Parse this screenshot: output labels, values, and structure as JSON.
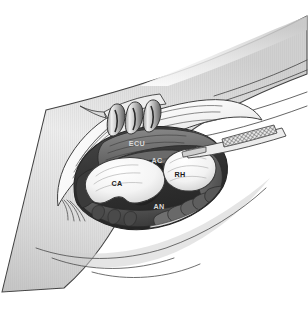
{
  "figure": {
    "type": "anatomical-surgical-illustration",
    "style": "grayscale line-and-tone medical illustration",
    "background_color": "#ffffff",
    "width": 308,
    "height": 330
  },
  "labels": [
    {
      "id": "ecu",
      "text": "ECU",
      "meaning": "extensor carpi ulnaris",
      "x": 137,
      "y": 146,
      "tone": "on-dark"
    },
    {
      "id": "ac",
      "text": "AC",
      "meaning": "articular capsule",
      "x": 157,
      "y": 163,
      "tone": "on-dark"
    },
    {
      "id": "ca",
      "text": "CA",
      "meaning": "capitellum",
      "x": 117,
      "y": 186,
      "tone": "on-light"
    },
    {
      "id": "rh",
      "text": "RH",
      "meaning": "radial head",
      "x": 180,
      "y": 177,
      "tone": "on-light"
    },
    {
      "id": "an",
      "text": "AN",
      "meaning": "anconeus",
      "x": 159,
      "y": 209,
      "tone": "on-dark"
    }
  ],
  "colors": {
    "paper": "#ffffff",
    "skin_light": "#f4f4f4",
    "skin_mid": "#d9d9d9",
    "skin_shadow": "#b8b8b8",
    "outline": "#3a3a3a",
    "cavity_deep": "#2b2b2b",
    "cavity_dark": "#3c3c3c",
    "muscle_mid": "#6e6e6e",
    "muscle_light": "#8d8d8d",
    "bone_white": "#f7f7f7",
    "bone_shade": "#d2d2d2",
    "metal_light": "#e6e6e6",
    "metal_dark": "#4a4a4a",
    "hatch": "#555555"
  },
  "structures": {
    "limb": "forearm / elbow region shown as a broad curved band running from lower-left to upper-right",
    "wound": "open elliptical surgical wound cavity in the centre of the limb",
    "retractor": "three-prong self-retaining retractor engaging the proximal wound edge",
    "instrument": "cross-hatched instrument blade entering the wound from the upper right",
    "bones": [
      "capitellum (CA)",
      "radial head (RH)"
    ],
    "soft_tissue": [
      "extensor carpi ulnaris (ECU)",
      "articular capsule (AC)",
      "anconeus (AN)"
    ],
    "tendon_slips_count": 5
  }
}
